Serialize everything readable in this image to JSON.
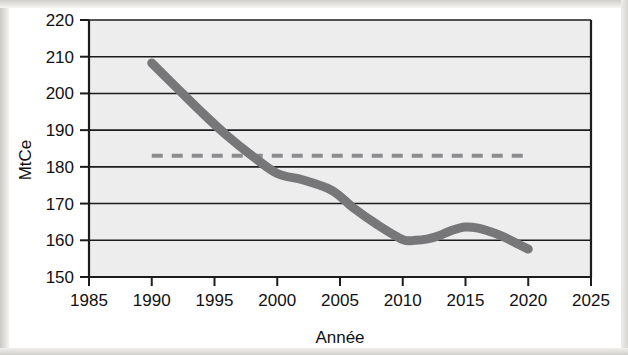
{
  "chart_data": {
    "type": "line",
    "title": "",
    "xlabel": "Année",
    "ylabel": "MtCe",
    "xlim": [
      1985,
      2025
    ],
    "ylim": [
      150,
      220
    ],
    "xticks": [
      1985,
      1990,
      1995,
      2000,
      2005,
      2010,
      2015,
      2020,
      2025
    ],
    "yticks": [
      150,
      160,
      170,
      180,
      190,
      200,
      210,
      220
    ],
    "grid": "horizontal",
    "legend": "none",
    "plot_background": "#ededed",
    "series": [
      {
        "name": "Émissions observées",
        "style": "solid",
        "color": "#77777a",
        "linewidth": 9,
        "x": [
          1990,
          1992,
          1994,
          1996,
          1998,
          2000,
          2002,
          2004,
          2005,
          2006,
          2008,
          2010,
          2011,
          2012,
          2013,
          2014,
          2015,
          2016,
          2017,
          2018,
          2019,
          2020
        ],
        "values": [
          208.3,
          201.5,
          194.8,
          188.5,
          183.0,
          178.2,
          176.5,
          174.2,
          172.0,
          169.0,
          164.2,
          160.2,
          160.0,
          160.4,
          161.4,
          162.8,
          163.6,
          163.3,
          162.3,
          161.0,
          159.3,
          157.6
        ]
      },
      {
        "name": "Objectif / référence",
        "style": "dashed",
        "color": "#8d8d90",
        "linewidth": 4,
        "x": [
          1990,
          2020
        ],
        "values": [
          183.0,
          183.0
        ]
      }
    ]
  },
  "axis": {
    "y_label": "MtCe",
    "x_label": "Année",
    "y_tick_labels": [
      "220",
      "210",
      "200",
      "190",
      "180",
      "170",
      "160",
      "150"
    ],
    "x_tick_labels": [
      "1985",
      "1990",
      "1995",
      "2000",
      "2005",
      "2010",
      "2015",
      "2020",
      "2025"
    ]
  },
  "colors": {
    "curve": "#77777a",
    "dashed": "#8d8d90",
    "gridline": "#1c1c1c",
    "axis": "#1c1c1c",
    "plot_fill": "#ededed",
    "text": "#111111"
  }
}
